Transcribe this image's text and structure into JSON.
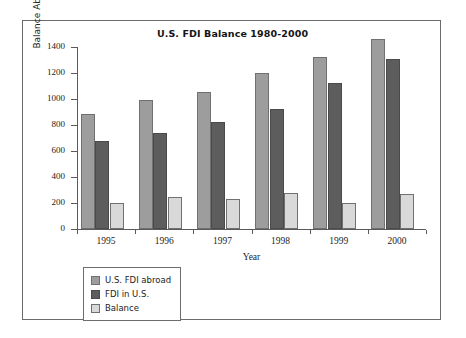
{
  "chart_data": {
    "type": "bar",
    "title": "U.S. FDI Balance 1980-2000",
    "xlabel": "Year",
    "ylabel": "Balance Abroad (in billions of collars)",
    "categories": [
      "1995",
      "1996",
      "1997",
      "1998",
      "1999",
      "2000"
    ],
    "series": [
      {
        "name": "U.S. FDI abroad",
        "color": "#9d9d9d",
        "values": [
          885,
          990,
          1055,
          1200,
          1325,
          1460
        ]
      },
      {
        "name": "FDI in U.S.",
        "color": "#5d5d5d",
        "values": [
          675,
          740,
          820,
          925,
          1120,
          1310
        ]
      },
      {
        "name": "Balance",
        "color": "#d9d9d9",
        "values": [
          200,
          243,
          232,
          278,
          200,
          272
        ]
      }
    ],
    "ylim": [
      0,
      1400
    ],
    "yticks": [
      0,
      200,
      400,
      600,
      800,
      1000,
      1200,
      1400
    ],
    "ytick_labels": [
      "0",
      "200",
      "400",
      "600",
      "800",
      "1000",
      "1200",
      "1400"
    ],
    "grid": false,
    "legend_position": "below-left",
    "legend_entries": [
      "U.S. FDI abroad",
      "FDI in U.S.",
      "Balance"
    ]
  }
}
